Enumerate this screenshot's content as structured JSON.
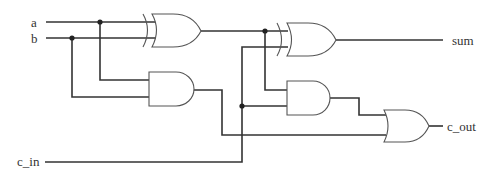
{
  "diagram": {
    "inputs": [
      {
        "id": "a",
        "label": "a"
      },
      {
        "id": "b",
        "label": "b"
      },
      {
        "id": "c_in",
        "label": "c_in"
      }
    ],
    "outputs": [
      {
        "id": "sum",
        "label": "sum"
      },
      {
        "id": "c_out",
        "label": "c_out"
      }
    ],
    "gates": [
      {
        "id": "xor1",
        "type": "XOR",
        "inputs": [
          "a",
          "b"
        ]
      },
      {
        "id": "and1",
        "type": "AND",
        "inputs": [
          "a",
          "b"
        ]
      },
      {
        "id": "xor2",
        "type": "XOR",
        "inputs": [
          "xor1",
          "c_in"
        ],
        "output": "sum"
      },
      {
        "id": "and2",
        "type": "AND",
        "inputs": [
          "xor1",
          "c_in"
        ]
      },
      {
        "id": "or1",
        "type": "OR",
        "inputs": [
          "and2",
          "and1"
        ],
        "output": "c_out"
      }
    ],
    "colors": {
      "wire": "#333333",
      "gate_stroke": "#555555",
      "background": "#ffffff"
    }
  }
}
